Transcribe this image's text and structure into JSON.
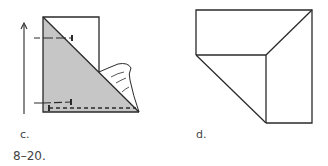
{
  "figure_number": "8–20.",
  "panels": [
    {
      "id": "c",
      "label": "c.",
      "elements": [
        "folded rectangle with shaded triangle",
        "upward arrow",
        "two pins",
        "dashed stitch line",
        "fabric flap"
      ]
    },
    {
      "id": "d",
      "label": "d.",
      "elements": [
        "mitered corner outline"
      ]
    }
  ],
  "colors": {
    "line": "#2a2a2a",
    "shade": "#c8c8c8",
    "background": "#ffffff"
  }
}
